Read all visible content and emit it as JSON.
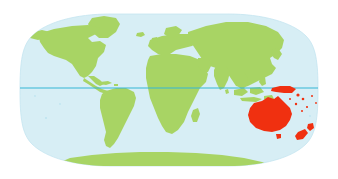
{
  "figure": {
    "name": "world-map-oceania-highlighted",
    "projection": "robinson",
    "background_color": "#ffffff",
    "ocean_color": "#d7eef5",
    "land_color": "#a8d464",
    "highlight_color": "#f03010",
    "equator_color": "#35b6d6",
    "ocean_edge_color": "#bfe4f0"
  },
  "map": {
    "bounds": {
      "x": 20,
      "y": 14,
      "width": 298,
      "height": 152
    },
    "equator": {
      "label": "equator",
      "y": 88,
      "x_start": 20,
      "x_end": 318,
      "color": "#35b6d6"
    }
  },
  "regions": {
    "land": [
      {
        "name": "north-america",
        "color": "#a8d464"
      },
      {
        "name": "greenland",
        "color": "#a8d464"
      },
      {
        "name": "south-america",
        "color": "#a8d464"
      },
      {
        "name": "europe",
        "color": "#a8d464"
      },
      {
        "name": "africa",
        "color": "#a8d464"
      },
      {
        "name": "asia",
        "color": "#a8d464"
      },
      {
        "name": "madagascar",
        "color": "#a8d464"
      },
      {
        "name": "japan",
        "color": "#a8d464"
      },
      {
        "name": "indonesia",
        "color": "#a8d464"
      },
      {
        "name": "british-isles",
        "color": "#a8d464"
      },
      {
        "name": "antarctica",
        "color": "#a8d464"
      },
      {
        "name": "iceland",
        "color": "#a8d464"
      },
      {
        "name": "caribbean-islands",
        "color": "#a8d464"
      }
    ],
    "highlighted": [
      {
        "name": "australia",
        "color": "#f03010"
      },
      {
        "name": "new-guinea",
        "color": "#f03010"
      },
      {
        "name": "new-zealand-north-island",
        "color": "#f03010"
      },
      {
        "name": "new-zealand-south-island",
        "color": "#f03010"
      },
      {
        "name": "tasmania",
        "color": "#f03010"
      },
      {
        "name": "pacific-islands",
        "color": "#f03010"
      }
    ]
  },
  "chart_data": {
    "type": "map",
    "title": "",
    "projection": "robinson",
    "legend": [],
    "highlighted_region": "Oceania",
    "highlight_color": "#f03010",
    "land_color": "#a8d464",
    "ocean_color": "#d7eef5",
    "gridlines": [
      "equator"
    ]
  }
}
